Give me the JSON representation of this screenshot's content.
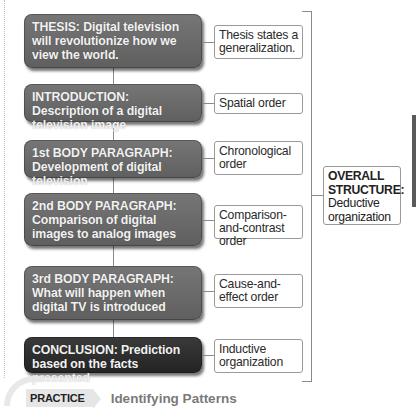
{
  "diagram": {
    "nodes": [
      {
        "id": "thesis",
        "text": "THESIS:  Digital television will revolutionize how we view the world.",
        "style": "medium"
      },
      {
        "id": "introduction",
        "text": "INTRODUCTION:  Description of a digital television image",
        "style": "medium"
      },
      {
        "id": "body1",
        "text": "1st BODY PARAGRAPH: Development of digital television",
        "style": "medium"
      },
      {
        "id": "body2",
        "text": "2nd BODY PARAGRAPH: Comparison of digital images to analog images",
        "style": "medium"
      },
      {
        "id": "body3",
        "text": "3rd BODY PARAGRAPH:  What will happen when digital TV is introduced",
        "style": "medium"
      },
      {
        "id": "conclusion",
        "text": "CONCLUSION:  Prediction based on the facts presented",
        "style": "dark"
      }
    ],
    "labels": [
      {
        "for": "thesis",
        "text": "Thesis states a generalization."
      },
      {
        "for": "introduction",
        "text": "Spatial order"
      },
      {
        "for": "body1",
        "text": "Chronological order"
      },
      {
        "for": "body2",
        "text": "Comparison-and-contrast order"
      },
      {
        "for": "body3",
        "text": "Cause-and-effect order"
      },
      {
        "for": "conclusion",
        "text": "Inductive organization"
      }
    ],
    "overall": {
      "heading": "OVERALL STRUCTURE:",
      "text": "Deductive organization"
    },
    "colors": {
      "node": "#6b6b6b",
      "node_dark": "#2e2e2e",
      "node_text": "#f2f2f2",
      "connector": "#8a8a8a"
    }
  },
  "footer": {
    "tag": "PRACTICE",
    "title": "Identifying Patterns"
  }
}
